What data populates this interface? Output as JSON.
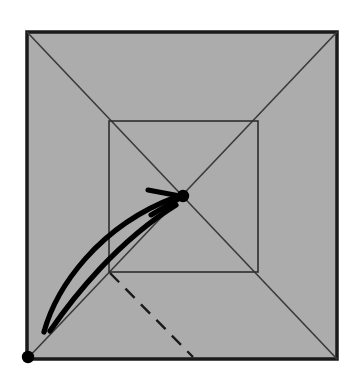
{
  "figure": {
    "type": "origami-fold-diagram",
    "canvas": {
      "width": 361,
      "height": 387,
      "background": "#ffffff"
    }
  },
  "colors": {
    "paper_fill": "#ACACAC",
    "paper_border": "#1A1A1A",
    "crease_line": "#3A3A3A",
    "inner_square_line": "#2E2E2E",
    "dashed_line": "#1A1A1A",
    "arrow": "#000000",
    "dot": "#000000"
  },
  "shapes": {
    "outer_square": {
      "label": "paper-sheet",
      "x": 27,
      "y": 32,
      "width": 310,
      "height": 327,
      "stroke_width": 3.5
    },
    "diagonals": [
      {
        "label": "crease-diagonal-tl-br",
        "x1": 27,
        "y1": 32,
        "x2": 337,
        "y2": 359,
        "stroke_width": 1.6
      },
      {
        "label": "crease-diagonal-tr-bl",
        "x1": 337,
        "y1": 32,
        "x2": 27,
        "y2": 359,
        "stroke_width": 1.6
      }
    ],
    "inner_square": {
      "label": "inner-crease-square",
      "x": 109,
      "y": 121,
      "width": 149,
      "height": 151,
      "stroke_width": 1.6
    },
    "dashed_fold_line": {
      "label": "valley-fold-dashed-line",
      "x1": 110,
      "y1": 273,
      "x2": 193,
      "y2": 357,
      "stroke_width": 2.4,
      "dash_pattern": "13 9"
    },
    "center_dot": {
      "label": "center-point-marker",
      "cx": 183,
      "cy": 196,
      "r": 6.2
    },
    "corner_dot": {
      "label": "corner-point-marker",
      "cx": 28,
      "cy": 357,
      "r": 6.2
    },
    "fold_arrow": {
      "label": "fold-motion-arrow",
      "outer_curve": "M 44 332 C 56 288, 98 226, 176 197",
      "inner_curve": "M 50 331 C 74 296, 118 241, 176 205",
      "head_upper": "M 148 190 L 180 196",
      "head_lower": "M 151 215 L 180 198",
      "stroke_width": 5.2,
      "head_stroke_width": 5.0
    }
  },
  "annotations": {
    "caption": ""
  }
}
